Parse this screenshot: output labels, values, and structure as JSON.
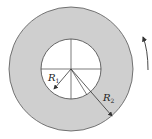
{
  "diagram": {
    "type": "annulus-rotation",
    "colors": {
      "ring_fill": "#cfcfcf",
      "inner_fill": "#ffffff",
      "stroke": "#333333"
    },
    "labels": {
      "inner_radius": "R",
      "inner_radius_sub": "1",
      "outer_radius": "R",
      "outer_radius_sub": "2"
    },
    "rotation_direction": "counterclockwise"
  }
}
